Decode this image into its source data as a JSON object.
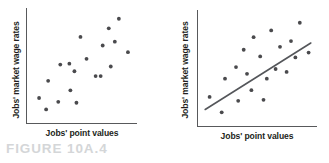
{
  "figure": {
    "caption": "FIGURE 10A.4",
    "caption_color": "#d4d6d8",
    "dot_color": "#4a4a4d",
    "axis_color": "#58595b",
    "trend_color": "#54565a",
    "background": "#ffffff"
  },
  "chart_data": [
    {
      "type": "scatter",
      "title": "",
      "xlabel": "Jobs' point values",
      "ylabel": "Jobs' market wage rates",
      "xlim": [
        0,
        100
      ],
      "ylim": [
        0,
        100
      ],
      "grid": false,
      "legend": null,
      "axis_ticks": false,
      "description": "Weak-to-moderate positive scatter with no fitted line",
      "series": [
        {
          "name": "jobs",
          "points": [
            [
              7,
              22
            ],
            [
              14,
              10
            ],
            [
              16,
              40
            ],
            [
              26,
              18
            ],
            [
              28,
              57
            ],
            [
              37,
              58
            ],
            [
              38,
              30
            ],
            [
              42,
              50
            ],
            [
              44,
              17
            ],
            [
              48,
              86
            ],
            [
              54,
              63
            ],
            [
              63,
              45
            ],
            [
              68,
              45
            ],
            [
              70,
              77
            ],
            [
              76,
              95
            ],
            [
              78,
              55
            ],
            [
              82,
              81
            ],
            [
              86,
              105
            ],
            [
              95,
              70
            ]
          ]
        }
      ]
    },
    {
      "type": "scatter",
      "title": "",
      "xlabel": "Jobs' point values",
      "ylabel": "Jobs' market wage rates",
      "xlim": [
        0,
        100
      ],
      "ylim": [
        0,
        100
      ],
      "grid": false,
      "legend": null,
      "axis_ticks": false,
      "description": "Positive scatter with fitted regression trend line",
      "series": [
        {
          "name": "jobs",
          "points": [
            [
              6,
              26
            ],
            [
              17,
              10
            ],
            [
              20,
              45
            ],
            [
              30,
              57
            ],
            [
              32,
              22
            ],
            [
              37,
              75
            ],
            [
              40,
              50
            ],
            [
              44,
              33
            ],
            [
              46,
              88
            ],
            [
              52,
              68
            ],
            [
              55,
              23
            ],
            [
              58,
              45
            ],
            [
              62,
              95
            ],
            [
              66,
              55
            ],
            [
              70,
              78
            ],
            [
              76,
              52
            ],
            [
              80,
              84
            ],
            [
              84,
              67
            ],
            [
              88,
              103
            ],
            [
              96,
              72
            ]
          ]
        }
      ],
      "trend_line": {
        "name": "regression-line",
        "x0": 2,
        "y0": 13,
        "x1": 98,
        "y1": 82
      }
    }
  ]
}
